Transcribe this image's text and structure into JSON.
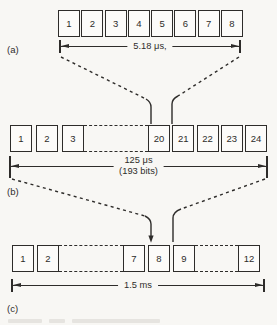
{
  "figure": {
    "colors": {
      "ink": "#2e2c2a",
      "background": "#f8f7f4"
    },
    "rows": {
      "a": {
        "label": "(a)",
        "cells": [
          "1",
          "2",
          "3",
          "4",
          "5",
          "6",
          "7",
          "8"
        ],
        "dimension_label": "5.18 μs,"
      },
      "b": {
        "label": "(b)",
        "cells_left": [
          "1",
          "2",
          "3"
        ],
        "cells_right": [
          "20",
          "21",
          "22",
          "23",
          "24"
        ],
        "dimension_label_line1": "125 μs",
        "dimension_label_line2": "(193 bits)"
      },
      "c": {
        "label": "(c)",
        "cells_left": [
          "1",
          "2"
        ],
        "cells_mid": [
          "7",
          "8",
          "9"
        ],
        "cells_right": [
          "12"
        ],
        "dimension_label": "1.5 ms"
      }
    }
  }
}
